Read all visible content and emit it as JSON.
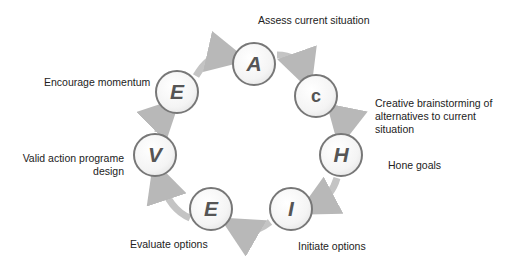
{
  "steps": [
    {
      "letter": "A",
      "label": "Assess current situation"
    },
    {
      "letter": "C",
      "label": "Creative brainstorming of alternatives to current situation"
    },
    {
      "letter": "H",
      "label": "Hone goals"
    },
    {
      "letter": "I",
      "label": "Initiate options"
    },
    {
      "letter": "E",
      "label": "Evaluate options"
    },
    {
      "letter": "V",
      "label": "Valid action programe design"
    },
    {
      "letter": "E",
      "label": "Encourage momentum"
    }
  ],
  "colors": {
    "arrow": "#b8b8b8",
    "circle_border": "#777777",
    "letter": "#555555"
  }
}
